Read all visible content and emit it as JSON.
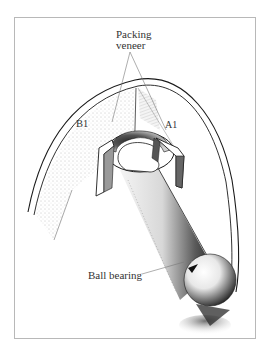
{
  "figure": {
    "frame": {
      "border_color": "#b8b8b8"
    },
    "labels": {
      "packing_veneer_line1": "Packing",
      "packing_veneer_line2": "veneer",
      "b1": "B1",
      "a1": "A1",
      "ball_bearing": "Ball bearing"
    },
    "parts": [
      {
        "id": "outer-arch",
        "description": "curved veneer arch / housing"
      },
      {
        "id": "wall-b1",
        "description": "hatched wall section B1 (left)"
      },
      {
        "id": "wall-a1",
        "description": "wall section A1 (right)"
      },
      {
        "id": "packing-veneer-left",
        "description": "left packing veneer strip"
      },
      {
        "id": "packing-veneer-right",
        "description": "right packing veneer strip"
      },
      {
        "id": "socket-cup",
        "description": "cup / socket holding ball end"
      },
      {
        "id": "shaft",
        "description": "shaded shaft running down-right"
      },
      {
        "id": "ball-bearing",
        "description": "spherical ball bearing with arrow"
      }
    ],
    "colors": {
      "ink": "#1a1a1a",
      "shade": "#555555",
      "light_shade": "#9a9a9a",
      "text": "#333333"
    }
  }
}
